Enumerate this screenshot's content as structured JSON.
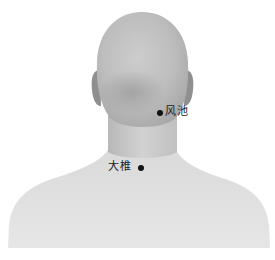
{
  "illustration": {
    "subject": "back-of-head-neck-shoulders",
    "colors": {
      "background": "#ffffff",
      "skin_light": "#e4e4e4",
      "skin_mid": "#c9c9c9",
      "skin_dark": "#9c9c9c",
      "ear": "#8f8f8f",
      "marker": "#111111",
      "label": "#1a1a1a"
    }
  },
  "points": [
    {
      "name": "风池",
      "dot": {
        "x": 160,
        "y": 113
      },
      "label_side": "right"
    },
    {
      "name": "大椎",
      "dot": {
        "x": 141,
        "y": 168
      },
      "label_side": "left"
    }
  ]
}
